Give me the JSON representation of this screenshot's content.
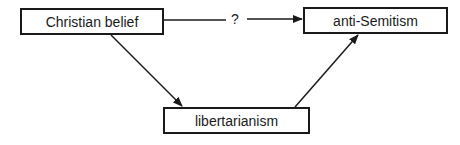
{
  "diagram": {
    "nodes": [
      {
        "id": "christian-belief",
        "label": "Christian belief"
      },
      {
        "id": "anti-semitism",
        "label": "anti-Semitism"
      },
      {
        "id": "libertarianism",
        "label": "libertarianism"
      }
    ],
    "edges": [
      {
        "from": "christian-belief",
        "to": "anti-semitism",
        "label": "?"
      },
      {
        "from": "christian-belief",
        "to": "libertarianism",
        "label": ""
      },
      {
        "from": "libertarianism",
        "to": "anti-semitism",
        "label": ""
      }
    ]
  }
}
